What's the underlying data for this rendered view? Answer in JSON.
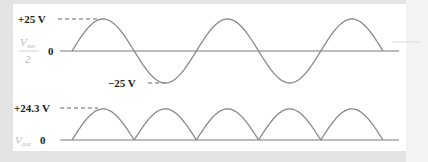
{
  "diagram": {
    "title": "",
    "top_waveform": {
      "signal_label": "V",
      "signal_subscript": "sec",
      "signal_denominator": "2",
      "zero_label": "0",
      "peak_label": "+25 V",
      "trough_label": "−25 V",
      "type": "sine",
      "cycles": 2.5
    },
    "bottom_waveform": {
      "signal_label": "V",
      "signal_subscript": "out",
      "zero_label": "0",
      "peak_label": "+24.3 V",
      "type": "full-wave rectified",
      "humps": 5
    },
    "colors": {
      "waveform": "#8a8a8a",
      "axis": "#7a7a7a",
      "label": "#222222",
      "variable_label": "#b8b8b8",
      "panel": "#ffffff",
      "background": "#e4e4e4"
    }
  },
  "chart_data": {
    "type": "line",
    "title": "",
    "series": [
      {
        "name": "Vsec/2",
        "peak": 25,
        "trough": -25,
        "units": "V",
        "shape": "sine",
        "half_cycles": 5
      },
      {
        "name": "Vout",
        "peak": 24.3,
        "min": 0,
        "units": "V",
        "shape": "full-wave rectified",
        "half_cycles": 5
      }
    ],
    "xlabel": "",
    "ylabel": "",
    "grid": false
  }
}
